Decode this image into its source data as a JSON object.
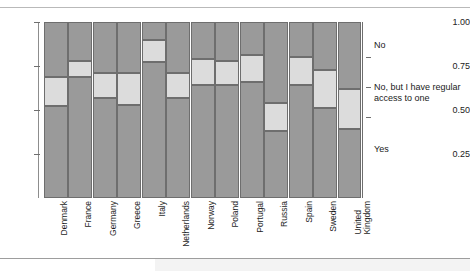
{
  "figure": {
    "title": "",
    "y_axis": {
      "ticks": [
        "1.00",
        "0.75",
        "0.50",
        "0.25"
      ],
      "tick_values": [
        1.0,
        0.75,
        0.5,
        0.25
      ]
    },
    "legend": {
      "no": "No",
      "regular_access": "No, but I have regular access to one",
      "yes": "Yes"
    },
    "colors": {
      "dark_segment": "#9a9a9a",
      "light_segment": "#dcdcdc",
      "segment_border": "#6e6e6e",
      "axis": "#8d8d8d",
      "text": "#1a1a1a",
      "background": "#ffffff"
    }
  },
  "chart_data": {
    "type": "bar",
    "subtype": "stacked-proportional-spine",
    "title": "",
    "xlabel": "",
    "ylabel": "",
    "ylim": [
      0,
      1
    ],
    "ytick_labels": [
      "0.25",
      "0.50",
      "0.75",
      "1.00"
    ],
    "grid": false,
    "legend_position": "right",
    "categories": [
      "Denmark",
      "France",
      "Germany",
      "Greece",
      "Italy",
      "Netherlands",
      "Norway",
      "Poland",
      "Portugal",
      "Russia",
      "Spain",
      "Sweden",
      "United Kingdom"
    ],
    "series": [
      {
        "name": "Yes",
        "values": [
          0.52,
          0.69,
          0.57,
          0.53,
          0.77,
          0.57,
          0.64,
          0.64,
          0.66,
          0.38,
          0.64,
          0.51,
          0.39
        ]
      },
      {
        "name": "No, but I have regular access to one",
        "values": [
          0.17,
          0.09,
          0.14,
          0.18,
          0.13,
          0.14,
          0.15,
          0.14,
          0.15,
          0.16,
          0.16,
          0.22,
          0.23
        ]
      },
      {
        "name": "No",
        "values": [
          0.31,
          0.22,
          0.29,
          0.29,
          0.1,
          0.29,
          0.21,
          0.22,
          0.19,
          0.46,
          0.2,
          0.27,
          0.38
        ]
      }
    ],
    "boundaries": [
      {
        "country": "Denmark",
        "lower": 0.52,
        "upper": 0.69
      },
      {
        "country": "France",
        "lower": 0.69,
        "upper": 0.78
      },
      {
        "country": "Germany",
        "lower": 0.57,
        "upper": 0.71
      },
      {
        "country": "Greece",
        "lower": 0.53,
        "upper": 0.71
      },
      {
        "country": "Italy",
        "lower": 0.77,
        "upper": 0.9
      },
      {
        "country": "Netherlands",
        "lower": 0.57,
        "upper": 0.71
      },
      {
        "country": "Norway",
        "lower": 0.64,
        "upper": 0.79
      },
      {
        "country": "Poland",
        "lower": 0.64,
        "upper": 0.78
      },
      {
        "country": "Portugal",
        "lower": 0.66,
        "upper": 0.81
      },
      {
        "country": "Russia",
        "lower": 0.38,
        "upper": 0.54
      },
      {
        "country": "Spain",
        "lower": 0.64,
        "upper": 0.8
      },
      {
        "country": "Sweden",
        "lower": 0.51,
        "upper": 0.73
      },
      {
        "country": "United Kingdom",
        "lower": 0.39,
        "upper": 0.62
      }
    ]
  }
}
